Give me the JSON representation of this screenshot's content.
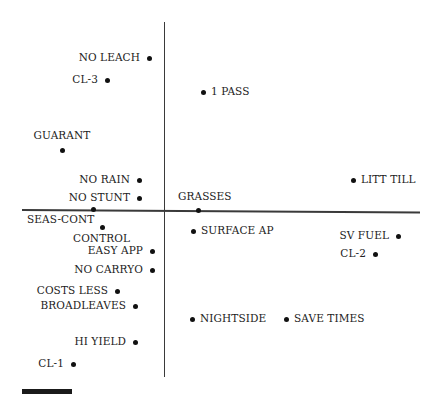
{
  "chart_data": {
    "type": "scatter",
    "title": "",
    "xlabel": "",
    "ylabel": "",
    "grid": false,
    "legend": null,
    "axes": "crossing at origin, no ticks",
    "xlim": [
      -1,
      1
    ],
    "ylim": [
      -1,
      1
    ],
    "points": [
      {
        "label": "NO LEACH",
        "x": -0.11,
        "y": 0.86
      },
      {
        "label": "CL-3",
        "x": -0.4,
        "y": 0.73
      },
      {
        "label": "1 PASS",
        "x": 0.27,
        "y": 0.66
      },
      {
        "label": "GUARANT",
        "x": -0.71,
        "y": 0.33
      },
      {
        "label": "NO RAIN",
        "x": -0.18,
        "y": 0.16
      },
      {
        "label": "NO STUNT",
        "x": -0.18,
        "y": 0.06
      },
      {
        "label": "LITT TILL",
        "x": 1.31,
        "y": 0.16
      },
      {
        "label": "GRASSES",
        "x": 0.24,
        "y": -0.01
      },
      {
        "label": "SEAS-CONT",
        "x": -0.5,
        "y": 0.0
      },
      {
        "label": "CONTROL",
        "x": -0.43,
        "y": -0.1
      },
      {
        "label": "SURFACE AP",
        "x": 0.2,
        "y": -0.12
      },
      {
        "label": "SV FUEL",
        "x": 1.62,
        "y": -0.15
      },
      {
        "label": "CL-2",
        "x": 1.47,
        "y": -0.25
      },
      {
        "label": "EASY APP",
        "x": -0.08,
        "y": -0.24
      },
      {
        "label": "NO CARRYO",
        "x": -0.08,
        "y": -0.34
      },
      {
        "label": "COSTS LESS",
        "x": -0.33,
        "y": -0.46
      },
      {
        "label": "BROADLEAVES",
        "x": -0.2,
        "y": -0.54
      },
      {
        "label": "NIGHTSIDE",
        "x": 0.2,
        "y": -0.62
      },
      {
        "label": "SAVE TIMES",
        "x": 0.85,
        "y": -0.62
      },
      {
        "label": "HI YIELD",
        "x": -0.2,
        "y": -0.75
      },
      {
        "label": "CL-1",
        "x": -0.64,
        "y": -0.87
      }
    ]
  },
  "plot": {
    "points": [
      {
        "label": "NO LEACH",
        "px": 149,
        "py": 58,
        "side": "left"
      },
      {
        "label": "CL-3",
        "px": 107,
        "py": 80,
        "side": "left"
      },
      {
        "label": "1 PASS",
        "px": 203,
        "py": 92,
        "side": "right"
      },
      {
        "label": "GUARANT",
        "px": 62,
        "py": 150,
        "side": "above"
      },
      {
        "label": "NO RAIN",
        "px": 139,
        "py": 180,
        "side": "left"
      },
      {
        "label": "NO STUNT",
        "px": 139,
        "py": 198,
        "side": "left"
      },
      {
        "label": "LITT TILL",
        "px": 353,
        "py": 180,
        "side": "right"
      },
      {
        "label": "GRASSES",
        "px": 198,
        "py": 210,
        "side": "above"
      },
      {
        "label": "SEAS-CONT",
        "px": 93,
        "py": 209,
        "side": "below"
      },
      {
        "label": "CONTROL",
        "px": 102,
        "py": 227,
        "side": "below"
      },
      {
        "label": "SURFACE AP",
        "px": 193,
        "py": 231,
        "side": "right"
      },
      {
        "label": "SV FUEL",
        "px": 398,
        "py": 236,
        "side": "left"
      },
      {
        "label": "CL-2",
        "px": 375,
        "py": 254,
        "side": "left"
      },
      {
        "label": "EASY APP",
        "px": 152,
        "py": 251,
        "side": "left"
      },
      {
        "label": "NO CARRYO",
        "px": 152,
        "py": 270,
        "side": "left"
      },
      {
        "label": "COSTS LESS",
        "px": 117,
        "py": 291,
        "side": "left"
      },
      {
        "label": "BROADLEAVES",
        "px": 135,
        "py": 306,
        "side": "left"
      },
      {
        "label": "NIGHTSIDE",
        "px": 192,
        "py": 319,
        "side": "right"
      },
      {
        "label": "SAVE TIMES",
        "px": 286,
        "py": 319,
        "side": "right"
      },
      {
        "label": "HI YIELD",
        "px": 135,
        "py": 342,
        "side": "left"
      },
      {
        "label": "CL-1",
        "px": 73,
        "py": 364,
        "side": "left"
      }
    ]
  },
  "caption": {
    "text": "FIGURE"
  }
}
